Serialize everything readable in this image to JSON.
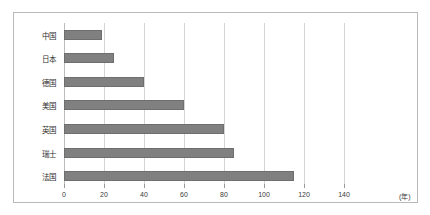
{
  "chart_data": {
    "type": "bar",
    "orientation": "horizontal",
    "title": "",
    "subtitle": "",
    "xlabel": "",
    "ylabel": "",
    "unit_label": "(年)",
    "categories": [
      "中国",
      "日本",
      "德国",
      "美国",
      "英国",
      "瑞士",
      "法国"
    ],
    "values": [
      19,
      25,
      40,
      60,
      80,
      85,
      115
    ],
    "series": [
      {
        "name": "",
        "values": [
          19,
          25,
          40,
          60,
          80,
          85,
          115
        ]
      }
    ],
    "xlim": [
      0,
      140
    ],
    "xticks": [
      0,
      20,
      40,
      60,
      80,
      100,
      120,
      140
    ],
    "xticklabels": [
      "0",
      "20",
      "40",
      "60",
      "80",
      "100",
      "120",
      "140"
    ],
    "grid": true,
    "grid_axis": "x",
    "legend": false,
    "legend_position": "none",
    "bar_color": "#808080",
    "bar_edge_color": "#6e6e6e",
    "grid_color": "#d4d4d4",
    "frame_color": "#b9b9b9",
    "background_color": "#ffffff",
    "text_color": "#2e2e2e"
  }
}
